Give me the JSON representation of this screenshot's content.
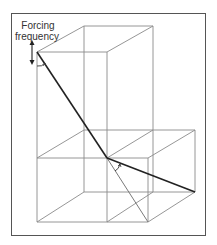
{
  "figure": {
    "label_line1": "Forcing",
    "label_line2": "frequency",
    "colors": {
      "frame": "#555555",
      "thin_line": "#8a8a8a",
      "heavy_line": "#222222",
      "text": "#333333"
    },
    "elements": [
      "outer-frame",
      "upper-cube-wireframe",
      "lower-left-box-wireframe",
      "lower-right-box-wireframe",
      "forcing-frequency-double-arrow",
      "heavy-pendulum-line-upper",
      "heavy-pendulum-line-lower",
      "thin-diagonal-line",
      "angle-arc-top",
      "angle-arc-center"
    ]
  }
}
